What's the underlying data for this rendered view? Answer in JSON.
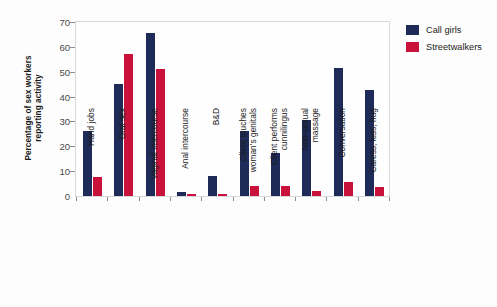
{
  "chart_data": {
    "type": "bar",
    "title": "",
    "xlabel": "",
    "ylabel_lines": [
      "Percentage of sex workers",
      "reporting activity"
    ],
    "ylabel": "Percentage of sex workers reporting activity",
    "ylim": [
      0,
      70
    ],
    "yticks": [
      0,
      10,
      20,
      30,
      40,
      50,
      60,
      70
    ],
    "ytick_labels": [
      "0",
      "10",
      "20",
      "30",
      "40",
      "50",
      "60",
      "70"
    ],
    "grid": false,
    "legend_position": "right",
    "categories": [
      "Hand jobs",
      "Oral sex",
      "Vaginal intercourse",
      "Anal intercourse",
      "B&D",
      "Client touches woman's genitals",
      "Client performs cunnilingus",
      "Non-sexual massage",
      "Conversation",
      "Caress, kiss, hug"
    ],
    "category_label_lines": [
      [
        "Hand jobs"
      ],
      [
        "Oral sex"
      ],
      [
        "Vaginal intercourse"
      ],
      [
        "Anal intercourse"
      ],
      [
        "B&D"
      ],
      [
        "Client touches",
        "woman's genitals"
      ],
      [
        "Client performs",
        "cunnilingus"
      ],
      [
        "Non-sexual",
        "massage"
      ],
      [
        "Conversation"
      ],
      [
        "Caress, kiss, hug"
      ]
    ],
    "series": [
      {
        "name": "Call girls",
        "color": "#1e2a57",
        "values": [
          26,
          45,
          65.5,
          1.5,
          8,
          26,
          17.5,
          30.5,
          51.5,
          42.5
        ]
      },
      {
        "name": "Streetwalkers",
        "color": "#c8123c",
        "values": [
          7.5,
          57,
          51,
          0.7,
          0.8,
          4,
          4,
          2,
          5.5,
          3.5
        ]
      }
    ]
  },
  "legend": {
    "items": [
      {
        "label": "Call girls",
        "color": "#1e2a57"
      },
      {
        "label": "Streetwalkers",
        "color": "#c8123c"
      }
    ]
  }
}
